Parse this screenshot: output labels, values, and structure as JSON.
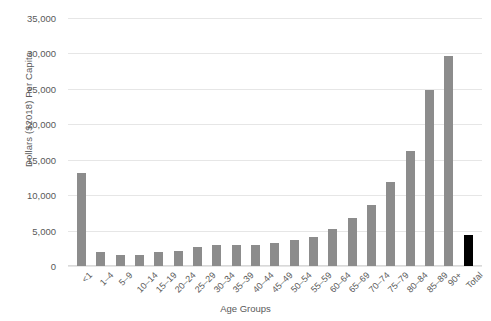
{
  "chart_data": {
    "type": "bar",
    "title": "",
    "xlabel": "Age Groups",
    "ylabel": "Dollars ($2018) Per Capita",
    "ylim": [
      0,
      35000
    ],
    "ytick_labels": [
      "35,000",
      "30,000",
      "25,000",
      "20,000",
      "15,000",
      "10,000",
      "5,000",
      "0"
    ],
    "ytick_values": [
      35000,
      30000,
      25000,
      20000,
      15000,
      10000,
      5000,
      0
    ],
    "grid": true,
    "legend": "none",
    "categories": [
      "<1",
      "1–4",
      "5–9",
      "10–14",
      "15–19",
      "20–24",
      "25–29",
      "30–34",
      "35–39",
      "40–44",
      "45–49",
      "50–54",
      "55–59",
      "60–64",
      "65–69",
      "70–74",
      "75–79",
      "80–84",
      "85–89",
      "90+",
      "Total"
    ],
    "values": [
      13100,
      2000,
      1550,
      1550,
      2000,
      2100,
      2700,
      2900,
      2900,
      3000,
      3300,
      3700,
      4100,
      5200,
      6800,
      8600,
      11800,
      16200,
      24800,
      29600,
      4400
    ],
    "colors": {
      "bar": "#8c8c8c",
      "total_bar": "#000000",
      "gridline": "#e6e6e6",
      "text": "#595959",
      "background": "#ffffff"
    },
    "highlight_category": "Total"
  }
}
